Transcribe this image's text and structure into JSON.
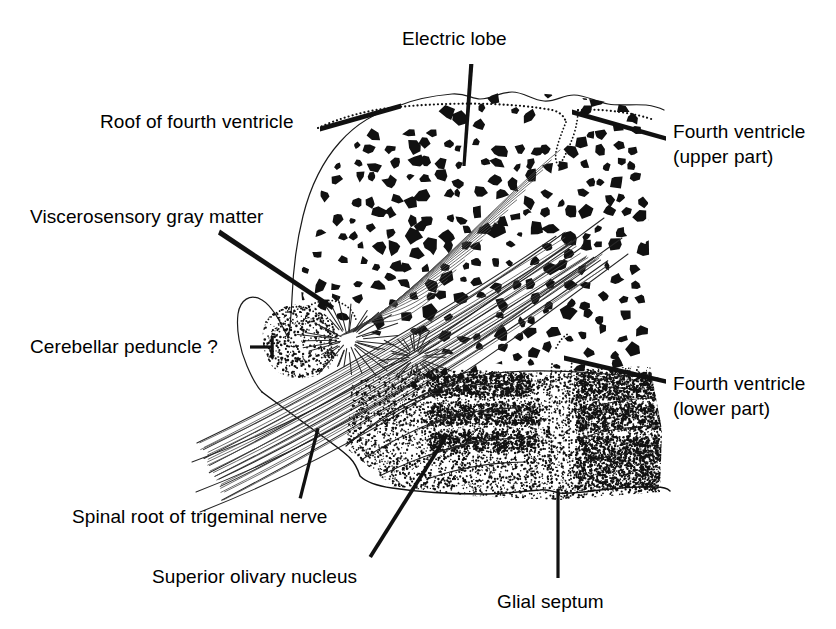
{
  "figure": {
    "kind": "anatomical-line-drawing",
    "background_color": "#ffffff",
    "ink_color": "#111111"
  },
  "labels": [
    {
      "id": "electric-lobe",
      "text": "Electric lobe",
      "x": 402,
      "y": 27,
      "leader": {
        "type": "tapered-line",
        "from": [
          471,
          66
        ],
        "to": [
          463,
          165
        ]
      }
    },
    {
      "id": "roof-of-fourth-ventricle",
      "text": "Roof of fourth ventricle",
      "x": 100,
      "y": 110,
      "leader": {
        "type": "tapered-line",
        "from": [
          322,
          129
        ],
        "to": [
          400,
          106
        ]
      }
    },
    {
      "id": "fourth-ventricle-upper",
      "text": "Fourth ventricle\n(upper part)",
      "x": 673,
      "y": 120,
      "leader": {
        "type": "tapered-line",
        "from": [
          664,
          138
        ],
        "to": [
          574,
          112
        ]
      }
    },
    {
      "id": "viscerosensory-gray-matter",
      "text": "Viscerosensory gray matter",
      "x": 30,
      "y": 205,
      "leader": {
        "type": "tapered-line",
        "from": [
          222,
          232
        ],
        "to": [
          333,
          308
        ]
      }
    },
    {
      "id": "cerebellar-peduncle",
      "text": "Cerebellar peduncle ?",
      "x": 30,
      "y": 335,
      "leader": {
        "type": "tick-dash",
        "from": [
          252,
          347
        ],
        "to": [
          272,
          347
        ]
      }
    },
    {
      "id": "fourth-ventricle-lower",
      "text": "Fourth ventricle\n(lower part)",
      "x": 673,
      "y": 372,
      "leader": {
        "type": "tapered-line",
        "from": [
          664,
          381
        ],
        "to": [
          566,
          358
        ]
      }
    },
    {
      "id": "spinal-root-of-trigeminal-nerve",
      "text": "Spinal root of trigeminal nerve",
      "x": 72,
      "y": 505,
      "leader": {
        "type": "tapered-line",
        "from": [
          300,
          497
        ],
        "to": [
          318,
          430
        ]
      }
    },
    {
      "id": "superior-olivary-nucleus",
      "text": "Superior olivary nucleus",
      "x": 152,
      "y": 565,
      "leader": {
        "type": "tapered-line",
        "from": [
          370,
          556
        ],
        "to": [
          447,
          436
        ]
      }
    },
    {
      "id": "glial-septum",
      "text": "Glial septum",
      "x": 497,
      "y": 590,
      "leader": {
        "type": "straight-line",
        "from": [
          558,
          578
        ],
        "to": [
          558,
          490
        ]
      }
    }
  ],
  "regions": [
    {
      "id": "electric-lobe-region",
      "note": "dense black angular cell blobs filling upper mass"
    },
    {
      "id": "fourth-ventricle-upper-region",
      "note": "dotted V-shaped notch descending from roof apex"
    },
    {
      "id": "fourth-ventricle-lower-region",
      "note": "dotted vertical cleft in lower stippled mass"
    },
    {
      "id": "viscerosensory-gray-matter-region",
      "note": "dotted arc over small left lobe"
    },
    {
      "id": "cerebellar-peduncle-region",
      "note": "stippled oval lobe at left with radiating fibers"
    },
    {
      "id": "spinal-root-trigeminal-region",
      "note": "long diagonal bundle of fiber lines lower-left"
    },
    {
      "id": "superior-olivary-nucleus-region",
      "note": "stippled striated field lower-centre"
    },
    {
      "id": "glial-septum-region",
      "note": "vertical unstippled gap splitting lower mass"
    }
  ]
}
